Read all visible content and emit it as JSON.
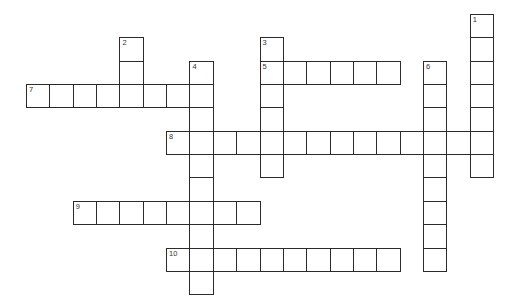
{
  "puzzle": {
    "type": "crossword",
    "cell_size": 23.35,
    "origin": {
      "x": 26,
      "y": 14
    },
    "entries": [
      {
        "number": "1",
        "direction": "down",
        "row": 0,
        "col": 19,
        "length": 7
      },
      {
        "number": "2",
        "direction": "down",
        "row": 1,
        "col": 4,
        "length": 3
      },
      {
        "number": "3",
        "direction": "down",
        "row": 1,
        "col": 10,
        "length": 6
      },
      {
        "number": "4",
        "direction": "down",
        "row": 2,
        "col": 7,
        "length": 10
      },
      {
        "number": "5",
        "direction": "across",
        "row": 2,
        "col": 10,
        "length": 6
      },
      {
        "number": "6",
        "direction": "down",
        "row": 2,
        "col": 17,
        "length": 9
      },
      {
        "number": "7",
        "direction": "across",
        "row": 3,
        "col": 0,
        "length": 8
      },
      {
        "number": "8",
        "direction": "across",
        "row": 5,
        "col": 6,
        "length": 14
      },
      {
        "number": "9",
        "direction": "across",
        "row": 8,
        "col": 2,
        "length": 8
      },
      {
        "number": "10",
        "direction": "across",
        "row": 10,
        "col": 6,
        "length": 10
      }
    ]
  }
}
